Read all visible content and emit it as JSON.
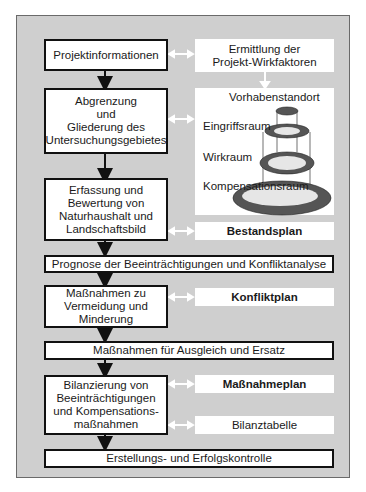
{
  "diagram": {
    "main_flow": [
      {
        "id": "projektinformationen",
        "label": "Projektinformationen"
      },
      {
        "id": "abgrenzung",
        "label": "Abgrenzung\nund\nGliederung des\nUntersuchungsgebietes"
      },
      {
        "id": "erfassung",
        "label": "Erfassung und\nBewertung von\nNaturhaushalt und\nLandschaftsbild"
      },
      {
        "id": "prognose",
        "label": "Prognose der Beeinträchtigungen und Konfliktanalyse"
      },
      {
        "id": "massnahmen-vermeidung",
        "label": "Maßnahmen zu\nVermeidung und\nMinderung"
      },
      {
        "id": "ausgleich",
        "label": "Maßnahmen für Ausgleich und Ersatz"
      },
      {
        "id": "bilanzierung",
        "label": "Bilanzierung von\nBeeinträchtigungen\nund Kompensations-\nmaßnahmen"
      },
      {
        "id": "kontrolle",
        "label": "Erstellungs- und Erfolgskontrolle"
      }
    ],
    "side_boxes": [
      {
        "id": "wirkfaktoren",
        "label": "Ermittlung der\nProjekt-Wirkfaktoren",
        "bold": false
      },
      {
        "id": "bestandsplan",
        "label": "Bestandsplan",
        "bold": true
      },
      {
        "id": "konfliktplan",
        "label": "Konfliktplan",
        "bold": true
      },
      {
        "id": "massnahmeplan",
        "label": "Maßnahmeplan",
        "bold": true
      },
      {
        "id": "bilanztabelle",
        "label": "Bilanztabelle",
        "bold": false
      }
    ],
    "space_illustration": {
      "labels": [
        "Vorhabenstandort",
        "Eingriffsraum",
        "Wirkraum",
        "Kompensationsraum"
      ]
    },
    "colors": {
      "background": "#cfcfcf",
      "box": "#ffffff",
      "border": "#111111",
      "ring": "#555555",
      "ring_inner": "#e6e6e6",
      "arrow_light": "#ffffff"
    }
  }
}
